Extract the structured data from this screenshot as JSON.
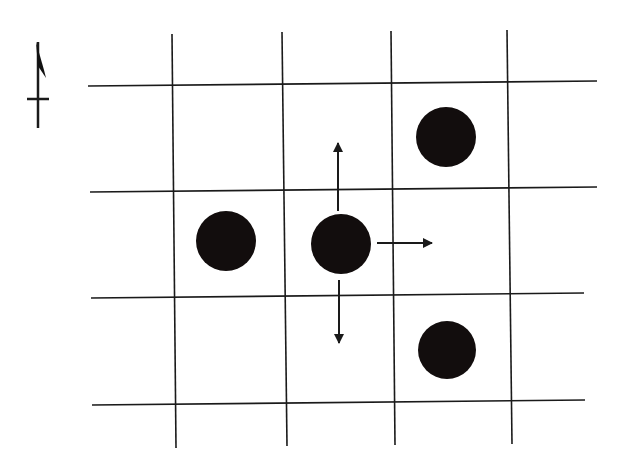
{
  "diagram": {
    "type": "grid-neighborhood",
    "colors": {
      "background": "#ffffff",
      "line": "#1a1a1a",
      "dot": "#120d0d"
    },
    "north_arrow": {
      "label": "north-arrow"
    },
    "grid": {
      "vertical_lines": [
        {
          "x1": 172,
          "y1": 34,
          "x2": 176,
          "y2": 448
        },
        {
          "x1": 282,
          "y1": 32,
          "x2": 287,
          "y2": 446
        },
        {
          "x1": 391,
          "y1": 31,
          "x2": 395,
          "y2": 445
        },
        {
          "x1": 507,
          "y1": 30,
          "x2": 512,
          "y2": 444
        }
      ],
      "horizontal_lines": [
        {
          "x1": 88,
          "y1": 86,
          "x2": 597,
          "y2": 81
        },
        {
          "x1": 90,
          "y1": 192,
          "x2": 597,
          "y2": 187
        },
        {
          "x1": 91,
          "y1": 298,
          "x2": 584,
          "y2": 293
        },
        {
          "x1": 92,
          "y1": 405,
          "x2": 585,
          "y2": 400
        }
      ]
    },
    "dots": [
      {
        "id": "dot-upper-right",
        "cx": 446,
        "cy": 137,
        "r": 30
      },
      {
        "id": "dot-left",
        "cx": 226,
        "cy": 241,
        "r": 30
      },
      {
        "id": "dot-center",
        "cx": 341,
        "cy": 244,
        "r": 30
      },
      {
        "id": "dot-lower-right",
        "cx": 447,
        "cy": 350,
        "r": 29
      }
    ],
    "arrows": [
      {
        "direction": "up",
        "x1": 338,
        "y1": 211,
        "x2": 338,
        "y2": 143
      },
      {
        "direction": "down",
        "x1": 339,
        "y1": 280,
        "x2": 339,
        "y2": 343
      },
      {
        "direction": "right",
        "x1": 377,
        "y1": 243,
        "x2": 432,
        "y2": 243
      }
    ]
  }
}
